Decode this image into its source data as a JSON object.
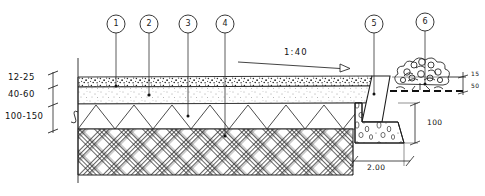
{
  "drawing": {
    "title": "Pavement and kerb cross-section detail",
    "type": "hand-drawn-section",
    "ink_color": "#202020",
    "paper_color": "#ffffff"
  },
  "callouts": [
    {
      "id": "1",
      "label": "1",
      "cx": 116,
      "cy": 24,
      "leader_x": 116,
      "leader_y_end": 86,
      "target_layer": "wearing-course"
    },
    {
      "id": "2",
      "label": "2",
      "cx": 149,
      "cy": 24,
      "leader_x": 149,
      "leader_y_end": 95,
      "target_layer": "bedding-course"
    },
    {
      "id": "3",
      "label": "3",
      "cx": 188,
      "cy": 24,
      "leader_x": 188,
      "leader_y_end": 116,
      "target_layer": "sub-base"
    },
    {
      "id": "4",
      "label": "4",
      "cx": 225,
      "cy": 24,
      "leader_x": 225,
      "leader_y_end": 136,
      "target_layer": "compacted-base"
    },
    {
      "id": "5",
      "label": "5",
      "cx": 374,
      "cy": 24,
      "leader_x": 374,
      "leader_y_end": 94,
      "target_layer": "concrete-kerb"
    },
    {
      "id": "6",
      "label": "6",
      "cx": 425,
      "cy": 22,
      "leader_x": 425,
      "leader_y_end": 84,
      "target_layer": "shrub-planting"
    }
  ],
  "thickness_labels": [
    {
      "text": "12-25",
      "x": 8,
      "y": 78
    },
    {
      "text": "40-60",
      "x": 8,
      "y": 94
    },
    {
      "text": "100-150",
      "x": 8,
      "y": 116
    }
  ],
  "annotations": {
    "slope": "1:40"
  },
  "dimensions": [
    {
      "name": "kerb-upstand",
      "text": "15",
      "x": 472,
      "y": 78
    },
    {
      "name": "kerb-depth",
      "text": "50",
      "x": 472,
      "y": 89
    },
    {
      "name": "footing-depth",
      "text": "100",
      "x": 428,
      "y": 122
    },
    {
      "name": "footing-width",
      "text": "2.00",
      "x": 370,
      "y": 170
    }
  ],
  "layers": [
    {
      "name": "wearing-course",
      "pattern": "speckled-aggregate"
    },
    {
      "name": "bedding-course",
      "pattern": "fine-stipple"
    },
    {
      "name": "sub-base",
      "pattern": "zigzag-triangles"
    },
    {
      "name": "compacted-base",
      "pattern": "basket-weave-hatch"
    }
  ],
  "elements": [
    {
      "name": "concrete-kerb",
      "pattern": "outline"
    },
    {
      "name": "kerb-footing",
      "pattern": "concrete-aggregate-dots"
    },
    {
      "name": "shrub-planting",
      "pattern": "freehand-foliage"
    },
    {
      "name": "ground-line",
      "pattern": "dashed"
    }
  ]
}
